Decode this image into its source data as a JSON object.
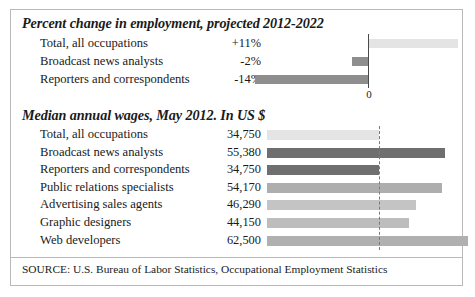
{
  "figure": {
    "source_note": "SOURCE: U.S. Bureau of Labor Statistics, Occupational Employment Statistics"
  },
  "colors": {
    "bar_light": "#e4e4e4",
    "bar_mid_light": "#c4c4c4",
    "bar_mid": "#aeaeae",
    "bar_gray": "#8e8e8e",
    "bar_dark": "#6f6f6f",
    "axis": "#4a4a4a",
    "border": "#b9b9b9",
    "text": "#1a1a1a"
  },
  "chart_data": [
    {
      "type": "bar",
      "orientation": "horizontal",
      "title": "Percent change in employment, projected 2012-2022",
      "xlabel": "",
      "ylabel": "",
      "axis_zero_label": "0",
      "grid": false,
      "legend": "none",
      "xlim": [
        -16,
        13
      ],
      "categories": [
        "Total, all occupations",
        "Broadcast news analysts",
        "Reporters and correspondents"
      ],
      "values": [
        11,
        -2,
        -14
      ],
      "value_labels": [
        "+11%",
        "-2%",
        "-14%"
      ],
      "bar_colors": [
        "#e4e4e4",
        "#8e8e8e",
        "#8e8e8e"
      ]
    },
    {
      "type": "bar",
      "orientation": "horizontal",
      "title": "Median annual wages, May 2012. In US $",
      "xlabel": "",
      "ylabel": "",
      "grid": false,
      "legend": "none",
      "reference_line_value": 34750,
      "xlim": [
        0,
        62500
      ],
      "categories": [
        "Total, all occupations",
        "Broadcast news analysts",
        "Reporters and correspondents",
        "Public relations specialists",
        "Advertising sales agents",
        "Graphic designers",
        "Web developers"
      ],
      "values": [
        34750,
        55380,
        34750,
        54170,
        46290,
        44150,
        62500
      ],
      "value_labels": [
        "34,750",
        "55,380",
        "34,750",
        "54,170",
        "46,290",
        "44,150",
        "62,500"
      ],
      "bar_colors": [
        "#e4e4e4",
        "#6f6f6f",
        "#6f6f6f",
        "#aeaeae",
        "#c4c4c4",
        "#bdbdbd",
        "#b0b0b0"
      ]
    }
  ]
}
